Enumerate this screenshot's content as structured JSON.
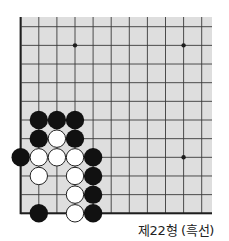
{
  "diagram": {
    "type": "go-board-problem",
    "caption": "제22형 (흑선)",
    "board": {
      "columns": 11,
      "rows": 11,
      "origin_x": 20.7,
      "origin_y": 26.7,
      "col_spacing": 18.1,
      "row_spacing": 18.66,
      "background_left": 19,
      "background_top": 17,
      "background_right": 212,
      "background_bottom": 214.5,
      "edge_left": true,
      "edge_bottom": true,
      "edge_top": false,
      "edge_right": false,
      "colors": {
        "background": "#dedede",
        "line": "#3a3a3a",
        "edge": "#1e1e1e",
        "black_stone": "#111111",
        "white_stone": "#ffffff",
        "white_stone_outline": "#222222"
      },
      "star_points": [
        {
          "col": 3,
          "row": 1
        },
        {
          "col": 9,
          "row": 1
        },
        {
          "col": 9,
          "row": 7
        }
      ],
      "stones": [
        {
          "color": "black",
          "col": 1,
          "row": 5
        },
        {
          "color": "black",
          "col": 2,
          "row": 5
        },
        {
          "color": "black",
          "col": 3,
          "row": 5
        },
        {
          "color": "black",
          "col": 1,
          "row": 6
        },
        {
          "color": "white",
          "col": 2,
          "row": 6
        },
        {
          "color": "black",
          "col": 3,
          "row": 6
        },
        {
          "color": "black",
          "col": 0,
          "row": 7
        },
        {
          "color": "white",
          "col": 1,
          "row": 7
        },
        {
          "color": "white",
          "col": 2,
          "row": 7
        },
        {
          "color": "white",
          "col": 3,
          "row": 7
        },
        {
          "color": "black",
          "col": 4,
          "row": 7
        },
        {
          "color": "white",
          "col": 1,
          "row": 8
        },
        {
          "color": "white",
          "col": 3,
          "row": 8
        },
        {
          "color": "black",
          "col": 4,
          "row": 8
        },
        {
          "color": "white",
          "col": 3,
          "row": 9
        },
        {
          "color": "black",
          "col": 4,
          "row": 9
        },
        {
          "color": "black",
          "col": 1,
          "row": 10
        },
        {
          "color": "white",
          "col": 3,
          "row": 10
        },
        {
          "color": "black",
          "col": 4,
          "row": 10
        }
      ],
      "stone_radius": 9.2,
      "star_radius": 2.2
    }
  }
}
